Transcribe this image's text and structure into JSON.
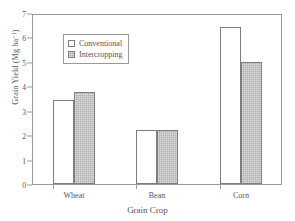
{
  "chart_data": {
    "type": "bar",
    "title": "",
    "xlabel": "Grain Crop",
    "ylabel": "Grain Yield (Mg ha⁻¹)",
    "categories": [
      "Wheat",
      "Bean",
      "Corn"
    ],
    "series": [
      {
        "name": "Conventional",
        "values": [
          3.48,
          2.25,
          6.52
        ],
        "color": "#ffffff"
      },
      {
        "name": "Intercropping",
        "values": [
          3.81,
          2.23,
          5.07
        ],
        "color": "#b0b0b0"
      }
    ],
    "ylim": [
      0,
      7
    ],
    "yticks": [
      0,
      1,
      2,
      3,
      4,
      5,
      6,
      7
    ],
    "ytick_labels": [
      "0",
      "1",
      "2",
      "3",
      "4",
      "5",
      "6",
      "7"
    ],
    "grid": false,
    "legend_position": "upper-left-inside",
    "frame": "box"
  },
  "legend": {
    "entries": [
      {
        "label": "Conventional",
        "marker": "open-square-swatch"
      },
      {
        "label": "Intercropping",
        "marker": "filled-square-swatch"
      }
    ]
  },
  "axes": {
    "y_title": "Grain Yield (Mg ha⁻¹)",
    "x_title": "Grain Crop",
    "y_tick_0": "0",
    "y_tick_1": "1",
    "y_tick_2": "2",
    "y_tick_3": "3",
    "y_tick_4": "4",
    "y_tick_5": "5",
    "y_tick_6": "6",
    "y_tick_7": "7",
    "x_tick_0": "Wheat",
    "x_tick_1": "Bean",
    "x_tick_2": "Corn"
  },
  "colors": {
    "axis": "#9a9a9a",
    "text": "#555555",
    "bar_border": "#7d7d7d",
    "conventional_fill": "#ffffff",
    "intercropping_fill": "#b0b0b0",
    "background": "#ffffff"
  }
}
